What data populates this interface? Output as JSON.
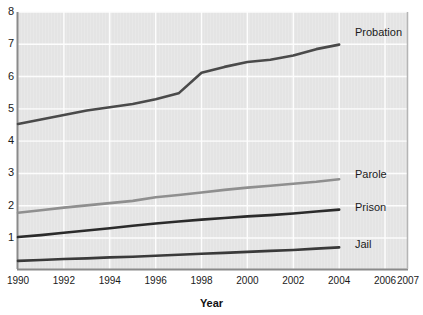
{
  "chart_data": {
    "type": "line",
    "title": "",
    "xlabel": "Year",
    "ylabel": "",
    "xlim": [
      1990,
      2007
    ],
    "ylim": [
      0,
      8
    ],
    "grid": true,
    "legend_position": "right-inline",
    "y_ticks": [
      1,
      2,
      3,
      4,
      5,
      6,
      7,
      8
    ],
    "y_tick_labels": [
      "1",
      "2",
      "3",
      "4",
      "5",
      "6",
      "7",
      "8"
    ],
    "x_ticks": [
      1990,
      1992,
      1994,
      1996,
      1998,
      2000,
      2002,
      2004,
      2006,
      2007
    ],
    "x_tick_labels": [
      "1990",
      "1992",
      "1994",
      "1996",
      "1998",
      "2000",
      "2002",
      "2004",
      "2006",
      "2007"
    ],
    "x": [
      1990,
      1991,
      1992,
      1993,
      1994,
      1995,
      1996,
      1997,
      1998,
      1999,
      2000,
      2001,
      2002,
      2003,
      2004
    ],
    "series": [
      {
        "name": "Probation",
        "color": "#4a4a4a",
        "values": [
          4.53,
          4.67,
          4.81,
          4.95,
          5.05,
          5.15,
          5.3,
          5.48,
          6.12,
          6.3,
          6.45,
          6.52,
          6.65,
          6.85,
          6.99
        ]
      },
      {
        "name": "Parole",
        "color": "#8f8f8f",
        "values": [
          1.78,
          1.86,
          1.94,
          2.01,
          2.08,
          2.15,
          2.26,
          2.33,
          2.41,
          2.49,
          2.56,
          2.62,
          2.68,
          2.74,
          2.82
        ]
      },
      {
        "name": "Prison",
        "color": "#2b2b2b",
        "values": [
          1.03,
          1.09,
          1.16,
          1.23,
          1.3,
          1.38,
          1.45,
          1.51,
          1.57,
          1.62,
          1.67,
          1.71,
          1.76,
          1.82,
          1.88
        ]
      },
      {
        "name": "Jail",
        "color": "#3a3a3a",
        "values": [
          0.29,
          0.32,
          0.35,
          0.37,
          0.4,
          0.42,
          0.45,
          0.48,
          0.51,
          0.54,
          0.57,
          0.6,
          0.63,
          0.67,
          0.71
        ]
      }
    ],
    "annotations": [
      {
        "label": "Probation",
        "x": 2004.6,
        "y": 7.35
      },
      {
        "label": "Parole",
        "x": 2004.6,
        "y": 2.95
      },
      {
        "label": "Prison",
        "x": 2004.6,
        "y": 1.93
      },
      {
        "label": "Jail",
        "x": 2004.6,
        "y": 0.77
      }
    ],
    "colors": {
      "plot_background": "#e4e4e4",
      "gridline": "#fdfdfd",
      "axis_line": "#8a8a8a",
      "text": "#1a1a1a"
    }
  },
  "axis_title": {
    "text": "Year"
  }
}
